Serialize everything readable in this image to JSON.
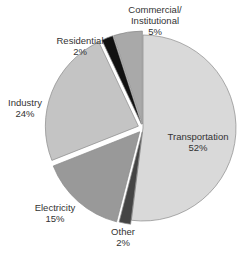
{
  "chart_data": {
    "type": "pie",
    "title": "",
    "categories": [
      "Transportation",
      "Other",
      "Electricity",
      "Industry",
      "Residential",
      "Commercial/ Institutional"
    ],
    "values": [
      52,
      2,
      15,
      24,
      2,
      5
    ],
    "unit": "%",
    "labels": [
      {
        "name": "Transportation",
        "value": "52%"
      },
      {
        "name": "Other",
        "value": "2%"
      },
      {
        "name": "Electricity",
        "value": "15%"
      },
      {
        "name": "Industry",
        "value": "24%"
      },
      {
        "name": "Residential",
        "value": "2%"
      },
      {
        "name_line1": "Commercial/",
        "name_line2": "Institutional",
        "value": "5%"
      }
    ],
    "colors": [
      "#d9d9d9",
      "#444444",
      "#999999",
      "#c4c4c4",
      "#111111",
      "#a9a9a9"
    ],
    "start_angle_deg": 0,
    "direction": "clockwise",
    "legend": "none (direct labels)"
  }
}
